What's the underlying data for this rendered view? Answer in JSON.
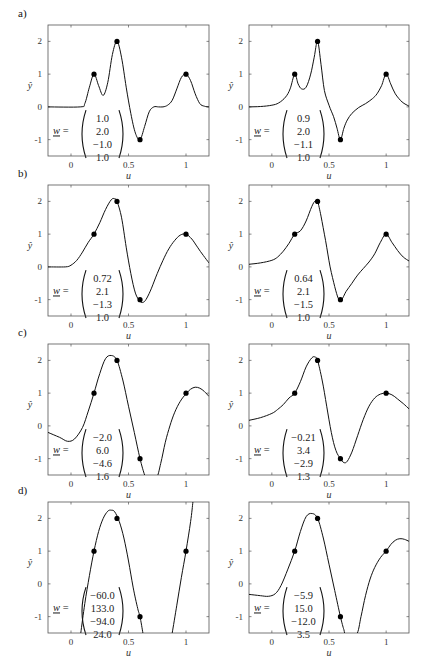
{
  "figure": {
    "rows": [
      "a)",
      "b)",
      "c)",
      "d)"
    ],
    "xlabel": "u",
    "ylabel": "ŷ",
    "w_label": "w =",
    "xticks": [
      "0",
      "0.5",
      "1"
    ],
    "yticks": [
      "2",
      "1",
      "0",
      "-1"
    ]
  },
  "chart_data": [
    {
      "type": "line",
      "panel": "a-left",
      "row_label": "a)",
      "xlabel": "u",
      "ylabel": "ŷ",
      "xlim": [
        -0.2,
        1.2
      ],
      "ylim": [
        -1.5,
        2.5
      ],
      "xticks": [
        0,
        0.5,
        1
      ],
      "yticks": [
        -1,
        0,
        1,
        2
      ],
      "points": {
        "x": [
          0.2,
          0.4,
          0.6,
          1.0
        ],
        "y": [
          1,
          2,
          -1,
          1
        ]
      },
      "w": [
        "1.0",
        "2.0",
        "−1.0",
        "1.0"
      ],
      "curve": {
        "x": [
          -0.2,
          0.08,
          0.12,
          0.16,
          0.2,
          0.24,
          0.28,
          0.32,
          0.36,
          0.4,
          0.44,
          0.48,
          0.52,
          0.56,
          0.6,
          0.64,
          0.68,
          0.72,
          0.76,
          0.8,
          0.84,
          0.88,
          0.92,
          0.96,
          1.0,
          1.04,
          1.08,
          1.12,
          1.16,
          1.2
        ],
        "y": [
          0,
          0,
          0.1,
          0.6,
          1.0,
          0.65,
          0.35,
          0.75,
          1.6,
          2.0,
          1.5,
          0.6,
          -0.2,
          -0.8,
          -1.0,
          -0.6,
          -0.15,
          0,
          0,
          0,
          0.05,
          0.2,
          0.55,
          0.9,
          1.0,
          0.8,
          0.4,
          0.1,
          0.02,
          0
        ]
      }
    },
    {
      "type": "line",
      "panel": "a-right",
      "row_label": "",
      "xlabel": "u",
      "ylabel": "ŷ",
      "xlim": [
        -0.2,
        1.2
      ],
      "ylim": [
        -1.5,
        2.5
      ],
      "xticks": [
        0,
        0.5,
        1
      ],
      "yticks": [
        -1,
        0,
        1,
        2
      ],
      "points": {
        "x": [
          0.2,
          0.4,
          0.6,
          1.0
        ],
        "y": [
          1,
          2,
          -1,
          1
        ]
      },
      "w": [
        "0.9",
        "2.0",
        "−1.1",
        "1.0"
      ],
      "curve": {
        "x": [
          -0.2,
          -0.1,
          0,
          0.06,
          0.12,
          0.16,
          0.2,
          0.23,
          0.26,
          0.3,
          0.34,
          0.37,
          0.4,
          0.43,
          0.46,
          0.5,
          0.54,
          0.57,
          0.6,
          0.63,
          0.66,
          0.7,
          0.76,
          0.82,
          0.88,
          0.92,
          0.96,
          1.0,
          1.04,
          1.08,
          1.14,
          1.2
        ],
        "y": [
          0,
          0.01,
          0.05,
          0.12,
          0.3,
          0.55,
          1.0,
          0.7,
          0.55,
          0.6,
          1.0,
          1.5,
          2.0,
          1.3,
          0.5,
          0.05,
          -0.3,
          -0.65,
          -1.0,
          -0.65,
          -0.4,
          -0.2,
          -0.02,
          0.1,
          0.25,
          0.4,
          0.65,
          1.0,
          0.7,
          0.4,
          0.15,
          0.02
        ]
      }
    },
    {
      "type": "line",
      "panel": "b-left",
      "row_label": "b)",
      "xlabel": "u",
      "ylabel": "ŷ",
      "xlim": [
        -0.2,
        1.2
      ],
      "ylim": [
        -1.5,
        2.5
      ],
      "xticks": [
        0,
        0.5,
        1
      ],
      "yticks": [
        -1,
        0,
        1,
        2
      ],
      "points": {
        "x": [
          0.2,
          0.4,
          0.6,
          1.0
        ],
        "y": [
          1,
          2,
          -1,
          1
        ]
      },
      "w": [
        "0.72",
        "2.1",
        "−1.3",
        "1.0"
      ],
      "curve": {
        "x": [
          -0.2,
          -0.05,
          0,
          0.05,
          0.1,
          0.15,
          0.2,
          0.25,
          0.3,
          0.35,
          0.38,
          0.4,
          0.44,
          0.48,
          0.52,
          0.56,
          0.6,
          0.63,
          0.66,
          0.7,
          0.75,
          0.8,
          0.85,
          0.9,
          0.95,
          1.0,
          1.05,
          1.1,
          1.15,
          1.2
        ],
        "y": [
          0,
          0,
          0.05,
          0.2,
          0.45,
          0.75,
          1.0,
          1.35,
          1.75,
          2.05,
          2.08,
          2.0,
          1.5,
          0.6,
          -0.2,
          -0.8,
          -1.05,
          -1.08,
          -0.95,
          -0.65,
          -0.2,
          0.2,
          0.55,
          0.8,
          0.97,
          1.0,
          0.85,
          0.6,
          0.35,
          0.12
        ]
      }
    },
    {
      "type": "line",
      "panel": "b-right",
      "row_label": "",
      "xlabel": "u",
      "ylabel": "ŷ",
      "xlim": [
        -0.2,
        1.2
      ],
      "ylim": [
        -1.5,
        2.5
      ],
      "xticks": [
        0,
        0.5,
        1
      ],
      "yticks": [
        -1,
        0,
        1,
        2
      ],
      "points": {
        "x": [
          0.2,
          0.4,
          0.6,
          1.0
        ],
        "y": [
          1,
          2,
          -1,
          1
        ]
      },
      "w": [
        "0.64",
        "2.1",
        "−1.5",
        "1.0"
      ],
      "curve": {
        "x": [
          -0.2,
          -0.1,
          0,
          0.05,
          0.1,
          0.15,
          0.2,
          0.25,
          0.3,
          0.35,
          0.38,
          0.4,
          0.43,
          0.47,
          0.51,
          0.55,
          0.58,
          0.6,
          0.62,
          0.65,
          0.7,
          0.75,
          0.8,
          0.85,
          0.9,
          0.95,
          1.0,
          1.05,
          1.1,
          1.15,
          1.2
        ],
        "y": [
          0.08,
          0.12,
          0.2,
          0.3,
          0.48,
          0.72,
          1.0,
          1.1,
          1.4,
          1.85,
          2.02,
          2.0,
          1.55,
          0.8,
          0.0,
          -0.6,
          -0.95,
          -1.02,
          -0.95,
          -0.75,
          -0.5,
          -0.25,
          -0.05,
          0.15,
          0.4,
          0.75,
          1.0,
          0.75,
          0.5,
          0.3,
          0.18
        ]
      }
    },
    {
      "type": "line",
      "panel": "c-left",
      "row_label": "c)",
      "xlabel": "u",
      "ylabel": "ŷ",
      "xlim": [
        -0.2,
        1.2
      ],
      "ylim": [
        -1.5,
        2.5
      ],
      "xticks": [
        0,
        0.5,
        1
      ],
      "yticks": [
        -1,
        0,
        1,
        2
      ],
      "points": {
        "x": [
          0.2,
          0.4,
          0.6,
          1.0
        ],
        "y": [
          1,
          2,
          -1,
          1
        ]
      },
      "w": [
        "−2.0",
        "6.0",
        "−4.6",
        "1.6"
      ],
      "curve": {
        "x": [
          -0.2,
          -0.1,
          -0.03,
          0.03,
          0.1,
          0.15,
          0.2,
          0.25,
          0.3,
          0.35,
          0.4,
          0.45,
          0.5,
          0.55,
          0.6,
          0.64,
          0.66,
          0.74,
          0.78,
          0.82,
          0.86,
          0.9,
          0.95,
          1.0,
          1.04,
          1.08,
          1.12,
          1.16,
          1.2
        ],
        "y": [
          -0.2,
          -0.35,
          -0.47,
          -0.4,
          -0.05,
          0.45,
          1.0,
          1.6,
          2.05,
          2.15,
          2.0,
          1.4,
          0.6,
          -0.2,
          -1.0,
          -1.5,
          -1.6,
          -1.6,
          -1.15,
          -0.5,
          0.0,
          0.4,
          0.75,
          0.98,
          1.12,
          1.18,
          1.15,
          1.05,
          0.9
        ]
      }
    },
    {
      "type": "line",
      "panel": "c-right",
      "row_label": "",
      "xlabel": "u",
      "ylabel": "ŷ",
      "xlim": [
        -0.2,
        1.2
      ],
      "ylim": [
        -1.5,
        2.5
      ],
      "xticks": [
        0,
        0.5,
        1
      ],
      "yticks": [
        -1,
        0,
        1,
        2
      ],
      "points": {
        "x": [
          0.2,
          0.4,
          0.6,
          1.0
        ],
        "y": [
          1,
          2,
          -1,
          1
        ]
      },
      "w": [
        "−0.21",
        "3.4",
        "−2.9",
        "1.3"
      ],
      "curve": {
        "x": [
          -0.2,
          -0.1,
          0,
          0.05,
          0.1,
          0.15,
          0.2,
          0.25,
          0.3,
          0.35,
          0.38,
          0.4,
          0.44,
          0.48,
          0.52,
          0.56,
          0.6,
          0.63,
          0.66,
          0.7,
          0.75,
          0.8,
          0.85,
          0.9,
          0.95,
          1.0,
          1.05,
          1.1,
          1.15,
          1.2
        ],
        "y": [
          0.17,
          0.25,
          0.38,
          0.5,
          0.65,
          0.85,
          1.0,
          1.35,
          1.8,
          2.08,
          2.1,
          2.0,
          1.4,
          0.6,
          -0.2,
          -0.75,
          -1.0,
          -1.12,
          -1.08,
          -0.8,
          -0.3,
          0.2,
          0.6,
          0.85,
          0.97,
          1.0,
          0.95,
          0.82,
          0.68,
          0.52
        ]
      }
    },
    {
      "type": "line",
      "panel": "d-left",
      "row_label": "d)",
      "xlabel": "u",
      "ylabel": "ŷ",
      "xlim": [
        -0.2,
        1.2
      ],
      "ylim": [
        -1.5,
        2.5
      ],
      "xticks": [
        0,
        0.5,
        1
      ],
      "yticks": [
        -1,
        0,
        1,
        2
      ],
      "points": {
        "x": [
          0.2,
          0.4,
          0.6,
          1.0
        ],
        "y": [
          1,
          2,
          -1,
          1
        ]
      },
      "w": [
        "−60.0",
        "133.0",
        "−94.0",
        "24.0"
      ],
      "curve": {
        "x": [
          0.085,
          0.12,
          0.16,
          0.2,
          0.24,
          0.28,
          0.32,
          0.35,
          0.38,
          0.42,
          0.46,
          0.5,
          0.54,
          0.58,
          0.6,
          0.625
        ],
        "y": [
          -1.5,
          -0.6,
          0.25,
          1.0,
          1.6,
          2.0,
          2.22,
          2.25,
          2.2,
          1.9,
          1.4,
          0.7,
          -0.1,
          -0.75,
          -1.0,
          -1.5
        ]
      },
      "curve2": {
        "x": [
          0.88,
          0.92,
          0.96,
          1.0,
          1.04,
          1.06
        ],
        "y": [
          -1.5,
          -0.65,
          0.2,
          1.0,
          1.9,
          2.5
        ]
      }
    },
    {
      "type": "line",
      "panel": "d-right",
      "row_label": "",
      "xlabel": "u",
      "ylabel": "ŷ",
      "xlim": [
        -0.2,
        1.2
      ],
      "ylim": [
        -1.5,
        2.5
      ],
      "xticks": [
        0,
        0.5,
        1
      ],
      "yticks": [
        -1,
        0,
        1,
        2
      ],
      "points": {
        "x": [
          0.2,
          0.4,
          0.6,
          1.0
        ],
        "y": [
          1,
          2,
          -1,
          1
        ]
      },
      "w": [
        "−5.9",
        "15.0",
        "−12.0",
        "3.5"
      ],
      "curve": {
        "x": [
          -0.2,
          -0.1,
          -0.03,
          0.03,
          0.08,
          0.14,
          0.2,
          0.25,
          0.3,
          0.35,
          0.4,
          0.45,
          0.5,
          0.55,
          0.6,
          0.63,
          0.65,
          0.74,
          0.78,
          0.82,
          0.86,
          0.9,
          0.95,
          1.0,
          1.04,
          1.08,
          1.12,
          1.16,
          1.2
        ],
        "y": [
          -0.32,
          -0.36,
          -0.38,
          -0.3,
          -0.05,
          0.45,
          1.0,
          1.6,
          2.05,
          2.15,
          2.0,
          1.4,
          0.6,
          -0.2,
          -1.0,
          -1.4,
          -1.55,
          -1.55,
          -1.0,
          -0.35,
          0.15,
          0.5,
          0.8,
          1.0,
          1.2,
          1.33,
          1.38,
          1.36,
          1.3
        ]
      }
    }
  ]
}
